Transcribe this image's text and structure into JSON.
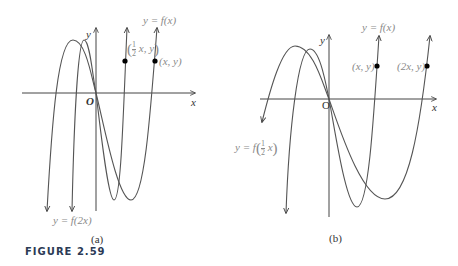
{
  "figure": {
    "caption": "FIGURE 2.59",
    "panels": [
      {
        "id": "a",
        "label": "(a)",
        "axis_labels": {
          "x": "x",
          "y": "y",
          "origin": "O"
        },
        "curves": [
          {
            "name": "y = f(x)",
            "label": "y = f(x)"
          },
          {
            "name": "y = f(2x)",
            "label": "y = f(2x)"
          }
        ],
        "points": [
          {
            "label_prefix": "",
            "frac_num": "1",
            "frac_den": "2",
            "label_suffix": "x, y",
            "label": "(1/2 x, y)"
          },
          {
            "label": "(x, y)"
          }
        ]
      },
      {
        "id": "b",
        "label": "(b)",
        "axis_labels": {
          "x": "x",
          "y": "y",
          "origin": "O"
        },
        "curves": [
          {
            "name": "y = f(x)",
            "label": "y = f(x)"
          },
          {
            "name": "y = f(1/2 x)",
            "label_prefix": "y = f",
            "frac_num": "1",
            "frac_den": "2",
            "label_suffix": "x"
          }
        ],
        "points": [
          {
            "label": "(x, y)"
          },
          {
            "label": "(2x, y)"
          }
        ]
      }
    ],
    "colors": {
      "curve": "#555555",
      "axis": "#444444",
      "label": "#8a8a8a",
      "point": "#000000",
      "caption": "#2b3a55"
    }
  }
}
